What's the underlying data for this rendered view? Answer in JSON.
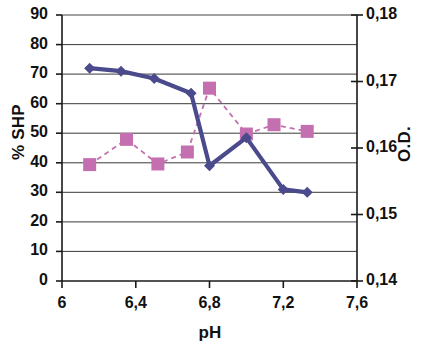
{
  "chart_data": {
    "type": "line",
    "title": "",
    "xlabel": "pH",
    "ylabel": "% SHP",
    "y2label": "O.D.",
    "xlim": [
      6,
      7.6
    ],
    "ylim": [
      0,
      90
    ],
    "y2lim": [
      0.14,
      0.18
    ],
    "xticks": [
      "6",
      "6,4",
      "6,8",
      "7,2",
      "7,6"
    ],
    "xtick_values": [
      6,
      6.4,
      6.8,
      7.2,
      7.6
    ],
    "yticks": [
      "0",
      "10",
      "20",
      "30",
      "40",
      "50",
      "60",
      "70",
      "80",
      "90"
    ],
    "ytick_values": [
      0,
      10,
      20,
      30,
      40,
      50,
      60,
      70,
      80,
      90
    ],
    "y2ticks": [
      "0,14",
      "0,15",
      "0,16",
      "0,17",
      "0,18"
    ],
    "y2tick_values": [
      0.14,
      0.15,
      0.16,
      0.17,
      0.18
    ],
    "grid": "horizontal",
    "legend": "none",
    "series": [
      {
        "name": "% SHP",
        "axis": "left",
        "color": "#4a4a8c",
        "marker": "diamond",
        "linestyle": "solid",
        "x": [
          6.15,
          6.32,
          6.5,
          6.7,
          6.8,
          7.0,
          7.2,
          7.33
        ],
        "values": [
          72,
          71,
          68.5,
          63.5,
          39,
          48.5,
          31,
          30
        ]
      },
      {
        "name": "O.D.",
        "axis": "right",
        "color": "#c46faf",
        "marker": "square",
        "linestyle": "dashed",
        "x": [
          6.15,
          6.35,
          6.52,
          6.68,
          6.8,
          7.0,
          7.15,
          7.33
        ],
        "values": [
          0.1575,
          0.1613,
          0.1576,
          0.1594,
          0.169,
          0.1621,
          0.1635,
          0.1625
        ]
      }
    ]
  },
  "axes": {
    "x_title": "pH",
    "y_left_title": "% SHP",
    "y_right_title": "O.D."
  },
  "ticks": {
    "left": [
      "90",
      "80",
      "70",
      "60",
      "50",
      "40",
      "30",
      "20",
      "10",
      "0"
    ],
    "right": [
      "0,18",
      "0,17",
      "0,16",
      "0,15",
      "0,14"
    ],
    "bottom": [
      "6",
      "6,4",
      "6,8",
      "7,2",
      "7,6"
    ]
  }
}
